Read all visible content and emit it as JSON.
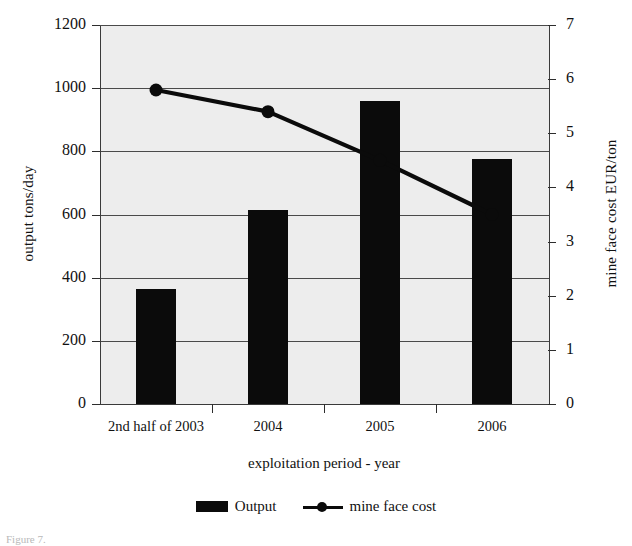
{
  "chart_data": {
    "type": "bar",
    "title": "",
    "categories": [
      "2nd half of 2003",
      "2004",
      "2005",
      "2006"
    ],
    "xlabel": "exploitation period - year",
    "ylabel": "output tons/day",
    "y2label": "mine face cost EUR/ton",
    "ylim": [
      0,
      1200
    ],
    "y2lim": [
      0,
      7
    ],
    "yticks": [
      0,
      200,
      400,
      600,
      800,
      1000,
      1200
    ],
    "y2ticks": [
      0,
      1,
      2,
      3,
      4,
      5,
      6,
      7
    ],
    "ytick_labels": [
      "0",
      "200",
      "400",
      "600",
      "800",
      "1000",
      "1200"
    ],
    "y2tick_labels": [
      "0",
      "1",
      "2",
      "3",
      "4",
      "5",
      "6",
      "7"
    ],
    "grid": true,
    "legend_position": "bottom",
    "series": [
      {
        "name": "Output",
        "type": "bar",
        "axis": "left",
        "color": "#0b0b0b",
        "values": [
          365,
          615,
          960,
          775
        ]
      },
      {
        "name": "mine face cost",
        "type": "line",
        "axis": "right",
        "color": "#0b0b0b",
        "marker": "circle",
        "values": [
          5.8,
          5.4,
          4.5,
          3.5
        ]
      }
    ]
  },
  "legend": {
    "items": [
      {
        "label": "Output",
        "marker": "bar-swatch"
      },
      {
        "label": "mine face cost",
        "marker": "line-marker-swatch"
      }
    ]
  },
  "caption": "Figure 7."
}
